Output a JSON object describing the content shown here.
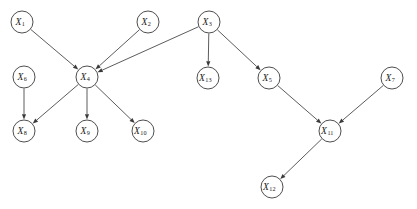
{
  "diagram": {
    "type": "directed-graph",
    "width": 417,
    "height": 209,
    "background_color": "#ffffff",
    "node_stroke_color": "#3a3a3a",
    "edge_stroke_color": "#4a4a4a",
    "label_color": "#1a1a1a",
    "node_radius": 11,
    "nodes": [
      {
        "id": "X1",
        "base": "X",
        "sub": "1",
        "label": "X1",
        "cx": 22,
        "cy": 22
      },
      {
        "id": "X2",
        "base": "X",
        "sub": "2",
        "label": "X2",
        "cx": 148,
        "cy": 22
      },
      {
        "id": "X3",
        "base": "X",
        "sub": "3",
        "label": "X3",
        "cx": 209,
        "cy": 22
      },
      {
        "id": "X6",
        "base": "X",
        "sub": "6",
        "label": "X6",
        "cx": 24,
        "cy": 77
      },
      {
        "id": "X4",
        "base": "X",
        "sub": "4",
        "label": "X4",
        "cx": 87,
        "cy": 77
      },
      {
        "id": "X13",
        "base": "X",
        "sub": "13",
        "label": "X13",
        "cx": 208,
        "cy": 78
      },
      {
        "id": "X5",
        "base": "X",
        "sub": "5",
        "label": "X5",
        "cx": 269,
        "cy": 78
      },
      {
        "id": "X7",
        "base": "X",
        "sub": "7",
        "label": "X7",
        "cx": 392,
        "cy": 78
      },
      {
        "id": "X8",
        "base": "X",
        "sub": "8",
        "label": "X8",
        "cx": 24,
        "cy": 131
      },
      {
        "id": "X9",
        "base": "X",
        "sub": "9",
        "label": "X9",
        "cx": 87,
        "cy": 131
      },
      {
        "id": "X10",
        "base": "X",
        "sub": "10",
        "label": "X10",
        "cx": 143,
        "cy": 131
      },
      {
        "id": "X11",
        "base": "X",
        "sub": "11",
        "label": "X11",
        "cx": 330,
        "cy": 131
      },
      {
        "id": "X12",
        "base": "X",
        "sub": "12",
        "label": "X12",
        "cx": 272,
        "cy": 187
      }
    ],
    "edges": [
      {
        "from": "X1",
        "to": "X4"
      },
      {
        "from": "X2",
        "to": "X4"
      },
      {
        "from": "X3",
        "to": "X4"
      },
      {
        "from": "X3",
        "to": "X13"
      },
      {
        "from": "X3",
        "to": "X5"
      },
      {
        "from": "X6",
        "to": "X8"
      },
      {
        "from": "X4",
        "to": "X8"
      },
      {
        "from": "X4",
        "to": "X9"
      },
      {
        "from": "X4",
        "to": "X10"
      },
      {
        "from": "X5",
        "to": "X11"
      },
      {
        "from": "X7",
        "to": "X11"
      },
      {
        "from": "X11",
        "to": "X12"
      }
    ]
  }
}
